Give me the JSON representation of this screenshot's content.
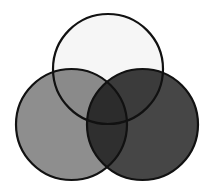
{
  "diagram": {
    "type": "venn-3",
    "canvas": {
      "width": 213,
      "height": 195,
      "background": "#ffffff"
    },
    "stroke": {
      "color": "#111111",
      "width": 2.2
    },
    "circles": [
      {
        "id": "top",
        "cx": 108,
        "cy": 69,
        "r": 55,
        "fill": "#f6f6f6"
      },
      {
        "id": "left",
        "cx": 71.5,
        "cy": 124.5,
        "r": 55.5,
        "fill": "#8e8e8e"
      },
      {
        "id": "right",
        "cx": 142.5,
        "cy": 124.5,
        "r": 55.5,
        "fill": "#464646"
      }
    ],
    "overlaps": {
      "top_left": "#8a8a8a",
      "top_right": "#3b3b3b",
      "left_right": "#2f2f2f",
      "all_three": "#2c2c2c"
    }
  }
}
